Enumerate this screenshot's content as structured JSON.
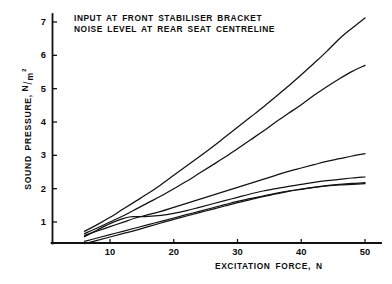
{
  "chart_data": {
    "type": "line",
    "title": "",
    "annotation_lines": [
      "INPUT AT FRONT STABILISER BRACKET",
      "NOISE LEVEL AT REAR SEAT CENTRELINE"
    ],
    "xlabel": "EXCITATION FORCE, N",
    "ylabel": "SOUND PRESSURE,",
    "ylabel_units_numerator": "N",
    "ylabel_units_slash": "/",
    "ylabel_units_denominator": "m",
    "ylabel_units_exponent": "2",
    "xlim": [
      4,
      52
    ],
    "ylim": [
      0,
      7.5
    ],
    "xticks": [
      10,
      20,
      30,
      40,
      50
    ],
    "xtick_labels": [
      "10",
      "20",
      "30",
      "40",
      "50"
    ],
    "yticks": [
      1,
      2,
      3,
      4,
      5,
      6,
      7
    ],
    "ytick_labels": [
      "1",
      "2",
      "3",
      "4",
      "5",
      "6",
      "7"
    ],
    "grid": false,
    "legend": false,
    "series": [
      {
        "name": "curve-1",
        "x": [
          6,
          8,
          10,
          12,
          14,
          16,
          18,
          20,
          22,
          24,
          26,
          28,
          30,
          32,
          34,
          36,
          38,
          40,
          42,
          44,
          46,
          48,
          50
        ],
        "values": [
          0.72,
          0.92,
          1.14,
          1.38,
          1.62,
          1.86,
          2.12,
          2.4,
          2.68,
          2.96,
          3.24,
          3.54,
          3.84,
          4.14,
          4.44,
          4.76,
          5.08,
          5.42,
          5.76,
          6.12,
          6.5,
          6.82,
          7.12
        ]
      },
      {
        "name": "curve-2",
        "x": [
          6,
          8,
          10,
          12,
          14,
          16,
          18,
          20,
          22,
          24,
          26,
          28,
          30,
          32,
          34,
          36,
          38,
          40,
          42,
          44,
          46,
          48,
          50
        ],
        "values": [
          0.65,
          0.82,
          1.0,
          1.18,
          1.38,
          1.58,
          1.78,
          2.0,
          2.22,
          2.46,
          2.7,
          2.94,
          3.2,
          3.46,
          3.72,
          4.0,
          4.26,
          4.52,
          4.8,
          5.06,
          5.3,
          5.52,
          5.7
        ]
      },
      {
        "name": "curve-3",
        "x": [
          6,
          8,
          10,
          12,
          14,
          16,
          18,
          20,
          22,
          24,
          26,
          28,
          30,
          32,
          34,
          36,
          38,
          40,
          42,
          44,
          46,
          48,
          50
        ],
        "values": [
          0.6,
          0.73,
          0.86,
          0.99,
          1.12,
          1.22,
          1.32,
          1.44,
          1.56,
          1.68,
          1.8,
          1.92,
          2.04,
          2.16,
          2.28,
          2.4,
          2.52,
          2.62,
          2.72,
          2.82,
          2.9,
          2.98,
          3.05
        ]
      },
      {
        "name": "curve-4",
        "x": [
          6,
          8,
          10,
          12,
          13,
          14,
          16,
          18,
          20,
          22,
          24,
          26,
          28,
          30,
          32,
          34,
          36,
          38,
          40,
          42,
          44,
          46,
          48,
          50
        ],
        "values": [
          0.56,
          0.76,
          0.95,
          1.1,
          1.15,
          1.16,
          1.17,
          1.2,
          1.26,
          1.34,
          1.44,
          1.54,
          1.64,
          1.74,
          1.84,
          1.93,
          2.0,
          2.07,
          2.13,
          2.19,
          2.24,
          2.28,
          2.32,
          2.35
        ]
      },
      {
        "name": "curve-5",
        "x": [
          6,
          8,
          10,
          12,
          14,
          16,
          18,
          20,
          22,
          24,
          26,
          28,
          30,
          32,
          34,
          36,
          38,
          40,
          42,
          44,
          46,
          48,
          50
        ],
        "values": [
          0.42,
          0.52,
          0.62,
          0.72,
          0.82,
          0.92,
          1.02,
          1.12,
          1.22,
          1.32,
          1.42,
          1.52,
          1.62,
          1.7,
          1.78,
          1.86,
          1.93,
          1.99,
          2.04,
          2.08,
          2.11,
          2.13,
          2.15
        ]
      },
      {
        "name": "curve-6",
        "x": [
          6,
          8,
          10,
          12,
          14,
          16,
          18,
          20,
          22,
          24,
          26,
          28,
          30,
          32,
          34,
          36,
          38,
          40,
          42,
          44,
          46,
          48,
          50
        ],
        "values": [
          0.35,
          0.45,
          0.55,
          0.65,
          0.75,
          0.86,
          0.97,
          1.08,
          1.18,
          1.28,
          1.38,
          1.48,
          1.58,
          1.67,
          1.76,
          1.84,
          1.92,
          1.98,
          2.04,
          2.09,
          2.13,
          2.16,
          2.18
        ]
      }
    ],
    "line_color": "#111111",
    "background_color": "#ffffff"
  }
}
